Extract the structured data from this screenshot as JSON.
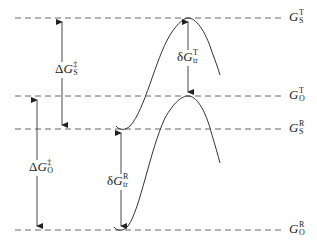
{
  "diagram": {
    "type": "free-energy-level-diagram",
    "levels": [
      {
        "id": "G_S_T",
        "symbol": "G",
        "sup": "T",
        "sub": "S",
        "y": 18
      },
      {
        "id": "G_O_T",
        "symbol": "G",
        "sup": "T",
        "sub": "O",
        "y": 96
      },
      {
        "id": "G_S_R",
        "symbol": "G",
        "sup": "R",
        "sub": "S",
        "y": 129
      },
      {
        "id": "G_O_R",
        "symbol": "G",
        "sup": "R",
        "sub": "O",
        "y": 230
      }
    ],
    "arrows": [
      {
        "id": "dG_S_act",
        "prefix": "Δ",
        "symbol": "G",
        "sup": "‡",
        "sub": "S",
        "from": "G_S_R",
        "to": "G_S_T"
      },
      {
        "id": "dG_O_act",
        "prefix": "Δ",
        "symbol": "G",
        "sup": "‡",
        "sub": "O",
        "from": "G_O_R",
        "to": "G_O_T"
      },
      {
        "id": "dG_tr_T",
        "prefix": "δ",
        "symbol": "G",
        "sup": "T",
        "sub": "tr",
        "from": "G_S_T",
        "to": "G_O_T"
      },
      {
        "id": "dG_tr_R",
        "prefix": "δ",
        "symbol": "G",
        "sup": "R",
        "sub": "tr",
        "from": "G_S_R",
        "to": "G_O_R"
      }
    ],
    "curves": [
      {
        "id": "upper-curve-S",
        "description": "S-state energy profile: reactant minimum at G_S^R, peak at G_S^T"
      },
      {
        "id": "lower-curve-O",
        "description": "O-state energy profile: reactant minimum at G_O^R, peak at G_O^T"
      }
    ],
    "labels": {
      "G_S_T": {
        "g": "G",
        "sup": "T",
        "sub": "S"
      },
      "G_O_T": {
        "g": "G",
        "sup": "T",
        "sub": "O"
      },
      "G_S_R": {
        "g": "G",
        "sup": "R",
        "sub": "S"
      },
      "G_O_R": {
        "g": "G",
        "sup": "R",
        "sub": "O"
      },
      "dGS": {
        "prefix": "Δ",
        "g": "G",
        "sup": "‡",
        "sub": "S"
      },
      "dGO": {
        "prefix": "Δ",
        "g": "G",
        "sup": "‡",
        "sub": "O"
      },
      "dGtrT": {
        "prefix": "δ",
        "g": "G",
        "sup": "T",
        "sub": "tr"
      },
      "dGtrR": {
        "prefix": "δ",
        "g": "G",
        "sup": "R",
        "sub": "tr"
      }
    },
    "colors": {
      "line": "#333333",
      "dash": "#555555",
      "background": "#ffffff"
    }
  }
}
